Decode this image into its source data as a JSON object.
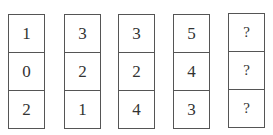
{
  "columns": [
    {
      "cells": [
        "1",
        "0",
        "2"
      ]
    },
    {
      "cells": [
        "3",
        "2",
        "1"
      ]
    },
    {
      "cells": [
        "3",
        "2",
        "4"
      ]
    },
    {
      "cells": [
        "5",
        "4",
        "3"
      ]
    },
    {
      "cells": [
        "?",
        "?",
        "?"
      ]
    }
  ]
}
